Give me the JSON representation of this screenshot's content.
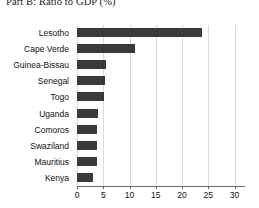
{
  "chart": {
    "title": "Part B: Ratio to GDP (%)",
    "bar_color": "#3a3a3a",
    "grid_color": "#d9d9d9",
    "axis_color": "#666666"
  },
  "chart_data": {
    "type": "bar",
    "orientation": "horizontal",
    "title": "Part B: Ratio to GDP (%)",
    "xlabel": "",
    "ylabel": "",
    "xlim": [
      0,
      32
    ],
    "ylim": null,
    "grid": true,
    "grid_axis": "x",
    "legend": false,
    "xticks": [
      0,
      5,
      10,
      15,
      20,
      25,
      30
    ],
    "xticklabels": [
      "0",
      "5",
      "10",
      "15",
      "20",
      "25",
      "30"
    ],
    "categories": [
      "Lesotho",
      "Cape Verde",
      "Guinea-Bissau",
      "Senegal",
      "Togo",
      "Uganda",
      "Comoros",
      "Swaziland",
      "Mauritius",
      "Kenya"
    ],
    "values": [
      23.8,
      11.0,
      5.5,
      5.4,
      5.1,
      4.0,
      3.9,
      3.9,
      3.8,
      3.1
    ]
  }
}
